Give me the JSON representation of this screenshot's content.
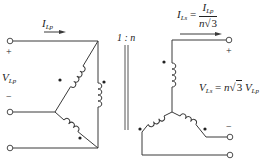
{
  "diagram": {
    "ratio_label": "1 : n",
    "primary": {
      "current_symbol": "I",
      "current_sub": "Lp",
      "voltage_symbol": "V",
      "voltage_sub": "Lp",
      "plus": "+",
      "minus": "−"
    },
    "secondary": {
      "current_symbol": "I",
      "current_sub": "Ls",
      "eq": "=",
      "frac_num_symbol": "I",
      "frac_num_sub": "Lp",
      "frac_den_n": "n",
      "frac_den_sqrt_sign": "√",
      "frac_den_sqrt_arg": "3",
      "voltage_symbol": "V",
      "voltage_sub": "Ls",
      "voltage_eq": "=",
      "voltage_n": "n",
      "voltage_sqrt_sign": "√",
      "voltage_sqrt_arg": "3",
      "voltage_rhs_symbol": "V",
      "voltage_rhs_sub": "Lp",
      "plus": "+",
      "minus": "−"
    },
    "colors": {
      "line": "#3a3a3a",
      "background": "#ffffff",
      "dot": "#222222"
    }
  }
}
